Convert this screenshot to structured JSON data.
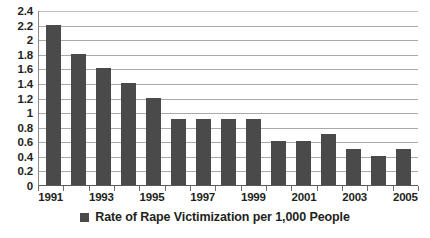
{
  "chart_data": {
    "type": "bar",
    "title": "",
    "subtitle": "",
    "xlabel": "",
    "ylabel": "",
    "categories": [
      "1991",
      "1992",
      "1993",
      "1994",
      "1995",
      "1996",
      "1997",
      "1998",
      "1999",
      "2000",
      "2001",
      "2002",
      "2003",
      "2004",
      "2005"
    ],
    "values": [
      2.2,
      1.8,
      1.6,
      1.4,
      1.2,
      0.9,
      0.9,
      0.9,
      0.9,
      0.6,
      0.6,
      0.7,
      0.5,
      0.4,
      0.5
    ],
    "series": [
      {
        "name": "Rate of Rape Victimization per 1,000 People",
        "values": [
          2.2,
          1.8,
          1.6,
          1.4,
          1.2,
          0.9,
          0.9,
          0.9,
          0.9,
          0.6,
          0.6,
          0.7,
          0.5,
          0.4,
          0.5
        ]
      }
    ],
    "ylim": [
      0,
      2.4
    ],
    "ytick_labels": [
      "2.4",
      "2.2",
      "2",
      "1.8",
      "1.6",
      "1.4",
      "1.2",
      "1",
      "0.8",
      "0.6",
      "0.4",
      "0.2",
      "0"
    ],
    "ytick_values": [
      2.4,
      2.2,
      2.0,
      1.8,
      1.6,
      1.4,
      1.2,
      1.0,
      0.8,
      0.6,
      0.4,
      0.2,
      0
    ],
    "ytick_step": 0.2,
    "xtick_labels": [
      "1991",
      "1993",
      "1995",
      "1997",
      "1999",
      "2001",
      "2003",
      "2005"
    ],
    "xtick_label_indices": [
      0,
      2,
      4,
      6,
      8,
      10,
      12,
      14
    ],
    "grid": true,
    "grid_axis": "y",
    "legend": {
      "position": "bottom",
      "entries": [
        {
          "label": "Rate of Rape Victimization per 1,000 People",
          "swatch_name": "legend-color-swatch"
        }
      ]
    },
    "colors": {
      "bar": "#4a4a4a",
      "gridline": "#a7a9ac",
      "axis": "#58595b",
      "text": "#231f20",
      "background": "#ffffff"
    }
  }
}
